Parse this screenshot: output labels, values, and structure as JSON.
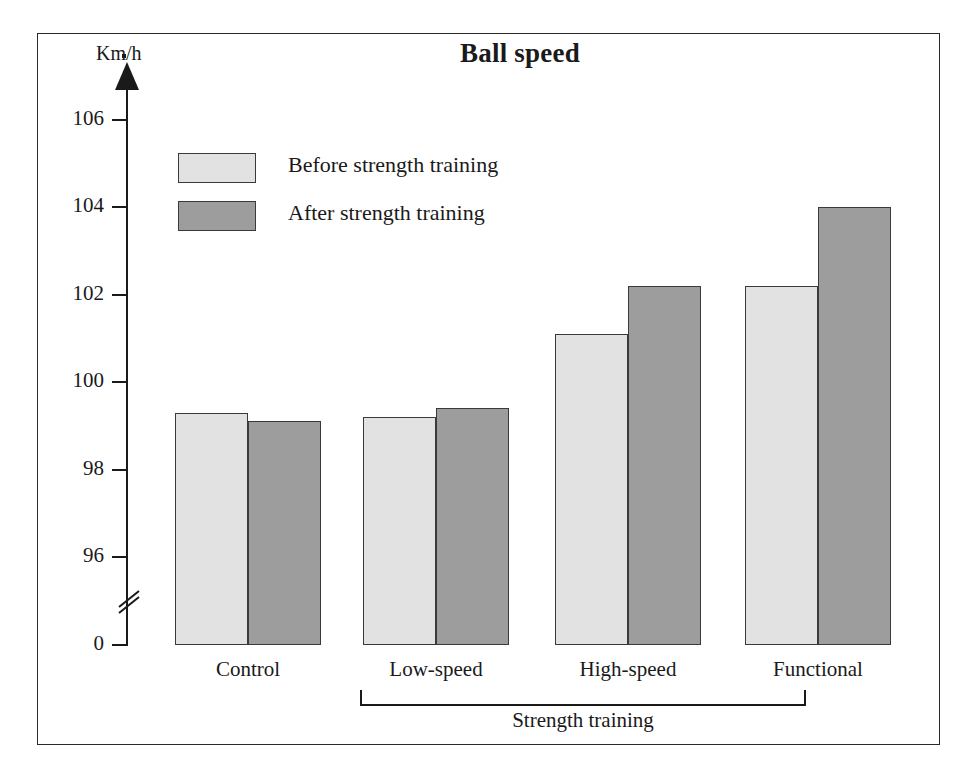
{
  "chart_data": {
    "type": "bar",
    "title": "Ball speed",
    "ylabel": "Km/h",
    "xlabel": "",
    "categories": [
      "Control",
      "Low-speed",
      "High-speed",
      "Functional"
    ],
    "series": [
      {
        "name": "Before strength training",
        "color": "#e2e2e2",
        "values": [
          99.3,
          99.2,
          101.1,
          102.2
        ]
      },
      {
        "name": "After strength training",
        "color": "#9d9d9d",
        "values": [
          99.1,
          99.4,
          102.2,
          104.0
        ]
      }
    ],
    "ytick_labels": [
      "106",
      "104",
      "102",
      "100",
      "98",
      "96",
      "0"
    ],
    "ytick_values": [
      106,
      104,
      102,
      100,
      98,
      96,
      0
    ],
    "ylim": [
      95.2,
      106.6
    ],
    "axis_break": true,
    "grid": false,
    "legend_position": "upper-left-inside",
    "group_bracket_label": "Strength training",
    "group_bracket_categories": [
      "Low-speed",
      "High-speed",
      "Functional"
    ]
  },
  "legend": {
    "items": [
      {
        "label": "Before strength training"
      },
      {
        "label": "After strength training"
      }
    ]
  },
  "axis": {
    "unit_label": "Km/h"
  }
}
